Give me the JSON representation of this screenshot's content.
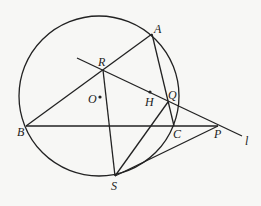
{
  "diagram": {
    "type": "geometry",
    "circle": {
      "center": [
        99,
        96
      ],
      "r": 80
    },
    "points": {
      "A": {
        "label": "A",
        "x": 152,
        "y": 34,
        "lx": 154,
        "ly": 33
      },
      "B": {
        "label": "B",
        "x": 26,
        "y": 126,
        "lx": 17,
        "ly": 136
      },
      "C": {
        "label": "C",
        "x": 174,
        "y": 126,
        "lx": 173,
        "ly": 138
      },
      "P": {
        "label": "P",
        "x": 218,
        "y": 126,
        "lx": 214,
        "ly": 138
      },
      "S": {
        "label": "S",
        "x": 115,
        "y": 176,
        "lx": 111,
        "ly": 190
      },
      "R": {
        "label": "R",
        "x": 103,
        "y": 70,
        "lx": 98,
        "ly": 66
      },
      "Q": {
        "label": "Q",
        "x": 168,
        "y": 102,
        "lx": 168,
        "ly": 99
      },
      "H": {
        "label": "H",
        "x": 150,
        "y": 92,
        "lx": 145,
        "ly": 106
      },
      "O": {
        "label": "O",
        "x": 100,
        "y": 97,
        "lx": 88,
        "ly": 103
      },
      "l": {
        "label": "l",
        "lx": 245,
        "ly": 145
      }
    },
    "segments": [
      [
        "A",
        "B"
      ],
      [
        "A",
        "C"
      ],
      [
        "B",
        "P"
      ],
      [
        "R",
        "S"
      ],
      [
        "Q",
        "S"
      ],
      [
        "S",
        "P"
      ]
    ],
    "line_l": {
      "from": [
        77,
        58
      ],
      "to": [
        242,
        136
      ]
    }
  }
}
